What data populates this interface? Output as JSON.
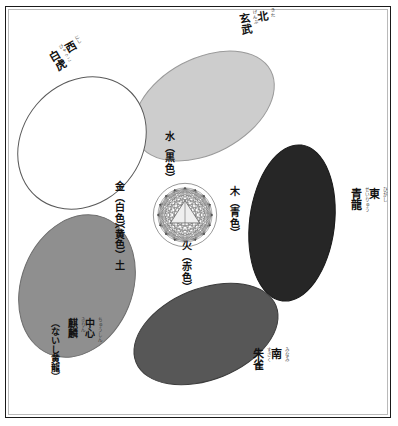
{
  "diagram": {
    "frame_color": "#1a1a1a",
    "background": "#ffffff"
  },
  "center_figure": {
    "name": "geometric-mandala",
    "description": "円形の多角形網目図形",
    "stroke_color": "#4a4a4a",
    "fill_color": "#e8e8e8"
  },
  "directions": [
    {
      "id": "north",
      "direction": "北",
      "direction_ruby": "きた",
      "beast": "玄武",
      "beast_ruby": "げんぶ",
      "position": "top"
    },
    {
      "id": "west",
      "direction": "西",
      "direction_ruby": "にし",
      "beast": "白虎",
      "beast_ruby": "びゃっこ",
      "position": "upper-left"
    },
    {
      "id": "east",
      "direction": "東",
      "direction_ruby": "ひがし",
      "beast": "青龍",
      "beast_ruby": "せいりゅう",
      "position": "right"
    },
    {
      "id": "south",
      "direction": "南",
      "direction_ruby": "みなみ",
      "beast": "朱雀",
      "beast_ruby": "すざく",
      "position": "bottom-right"
    },
    {
      "id": "center",
      "direction": "中心",
      "direction_ruby": "ちゅうしん",
      "beast": "麒麟",
      "beast_ruby": "きりん",
      "beast_alt": "（ないし黄龍）",
      "position": "bottom-left"
    }
  ],
  "elements": [
    {
      "id": "water",
      "label": "水（黒色）",
      "element": "水",
      "color_name": "黒色",
      "fill": "#cdcdcd",
      "stroke": "#9a9a9a"
    },
    {
      "id": "metal",
      "label": "金（白色）",
      "element": "金",
      "color_name": "白色",
      "fill": "#ffffff",
      "stroke": "#5a5a5a"
    },
    {
      "id": "wood",
      "label": "木（青色）",
      "element": "木",
      "color_name": "青色",
      "fill": "#262626",
      "stroke": "#1a1a1a"
    },
    {
      "id": "fire",
      "label": "火（赤色）",
      "element": "火",
      "color_name": "赤色",
      "fill": "#575757",
      "stroke": "#3d3d3d"
    },
    {
      "id": "earth",
      "label": "（黄色）土",
      "element": "土",
      "color_name": "黄色",
      "fill": "#8f8f8f",
      "stroke": "#6d6d6d"
    }
  ]
}
